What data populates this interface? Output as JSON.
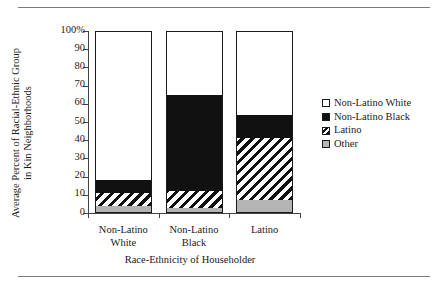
{
  "chart_data": {
    "type": "bar",
    "subtype": "stacked-100-percent",
    "title": "",
    "xlabel": "Race-Ethnicity of Householder",
    "ylabel": "Average Percent of Racial-Ethnic Group in Kin Neighborhoods",
    "ylabel_line1": "Average Percent of Racial-Ethnic Group",
    "ylabel_line2": "in Kin Neighborhoods",
    "categories": [
      "Non-Latino White",
      "Non-Latino Black",
      "Latino"
    ],
    "category_lines": [
      [
        "Non-Latino",
        "White"
      ],
      [
        "Non-Latino",
        "Black"
      ],
      [
        "Latino",
        ""
      ]
    ],
    "series": [
      {
        "name": "Other",
        "values": [
          4,
          3,
          7
        ],
        "fill": "gray"
      },
      {
        "name": "Latino",
        "values": [
          7,
          9,
          34
        ],
        "fill": "hatch"
      },
      {
        "name": "Non-Latino Black",
        "values": [
          7,
          53,
          13
        ],
        "fill": "black"
      },
      {
        "name": "Non-Latino White",
        "values": [
          82,
          35,
          46
        ],
        "fill": "white"
      }
    ],
    "stack_tops": {
      "Other": [
        4,
        3,
        7
      ],
      "Latino": [
        11,
        12,
        41
      ],
      "Non-Latino Black": [
        18,
        65,
        54
      ],
      "Non-Latino White": [
        100,
        100,
        100
      ]
    },
    "ylim": [
      0,
      100
    ],
    "yticks": [
      0,
      10,
      20,
      30,
      40,
      50,
      60,
      70,
      80,
      90,
      100
    ],
    "ytick_labels": [
      "0",
      "10",
      "20",
      "30",
      "40",
      "50",
      "60",
      "70",
      "80",
      "90",
      "100%"
    ],
    "grid": false,
    "legend_position": "right"
  },
  "legend": {
    "items": [
      {
        "label": "Non-Latino White",
        "fill": "white"
      },
      {
        "label": "Non-Latino Black",
        "fill": "black"
      },
      {
        "label": "Latino",
        "fill": "hatch"
      },
      {
        "label": "Other",
        "fill": "gray"
      }
    ]
  },
  "colors": {
    "black": "#111111",
    "gray": "#b4b4b4",
    "white": "#ffffff",
    "axis": "#444444",
    "rule": "#7a7a7a",
    "text": "#1a1a1a"
  }
}
